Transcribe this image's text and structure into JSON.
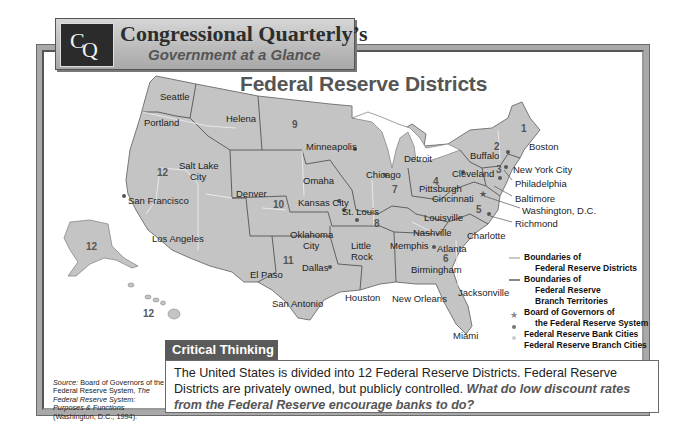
{
  "header": {
    "logo": {
      "c": "C",
      "q": "Q"
    },
    "title": "Congressional Quarterly’s",
    "subtitle": "Government at a Glance"
  },
  "map": {
    "title": "Federal Reserve Districts",
    "colors": {
      "land": "#c4c4c4",
      "boundary": "#555555",
      "branch": "#e8e8e8",
      "water": "#ffffff"
    },
    "cities": [
      {
        "name": "Seattle",
        "x": 160,
        "y": 91
      },
      {
        "name": "Portland",
        "x": 144,
        "y": 117
      },
      {
        "name": "Helena",
        "x": 226,
        "y": 113
      },
      {
        "name": "Salt Lake",
        "x": 179,
        "y": 160
      },
      {
        "name": "City",
        "x": 190,
        "y": 171
      },
      {
        "name": "San Francisco",
        "x": 128,
        "y": 195
      },
      {
        "name": "Los Angeles",
        "x": 152,
        "y": 233
      },
      {
        "name": "Denver",
        "x": 236,
        "y": 188
      },
      {
        "name": "Minneapolis",
        "x": 306,
        "y": 141
      },
      {
        "name": "Omaha",
        "x": 303,
        "y": 175
      },
      {
        "name": "Kansas City",
        "x": 298,
        "y": 197
      },
      {
        "name": "St. Louis",
        "x": 342,
        "y": 206
      },
      {
        "name": "Chicago",
        "x": 366,
        "y": 169
      },
      {
        "name": "Detroit",
        "x": 404,
        "y": 153
      },
      {
        "name": "Cleveland",
        "x": 452,
        "y": 168
      },
      {
        "name": "Pittsburgh",
        "x": 419,
        "y": 183
      },
      {
        "name": "Cincinnati",
        "x": 432,
        "y": 193
      },
      {
        "name": "Louisville",
        "x": 424,
        "y": 212
      },
      {
        "name": "Nashville",
        "x": 413,
        "y": 227
      },
      {
        "name": "Memphis",
        "x": 390,
        "y": 240
      },
      {
        "name": "Atlanta",
        "x": 437,
        "y": 243
      },
      {
        "name": "Birmingham",
        "x": 411,
        "y": 264
      },
      {
        "name": "Charlotte",
        "x": 467,
        "y": 230
      },
      {
        "name": "Buffalo",
        "x": 470,
        "y": 150
      },
      {
        "name": "Boston",
        "x": 529,
        "y": 141
      },
      {
        "name": "New York City",
        "x": 513,
        "y": 164
      },
      {
        "name": "Philadelphia",
        "x": 515,
        "y": 178
      },
      {
        "name": "Baltimore",
        "x": 515,
        "y": 193
      },
      {
        "name": "Washington, D.C.",
        "x": 522,
        "y": 205
      },
      {
        "name": "Richmond",
        "x": 515,
        "y": 218
      },
      {
        "name": "Oklahoma",
        "x": 290,
        "y": 229
      },
      {
        "name": "City",
        "x": 303,
        "y": 240
      },
      {
        "name": "Little",
        "x": 351,
        "y": 240
      },
      {
        "name": "Rock",
        "x": 351,
        "y": 251
      },
      {
        "name": "Dallas",
        "x": 302,
        "y": 262
      },
      {
        "name": "El Paso",
        "x": 250,
        "y": 269
      },
      {
        "name": "San Antonio",
        "x": 272,
        "y": 298
      },
      {
        "name": "Houston",
        "x": 345,
        "y": 292
      },
      {
        "name": "New Orleans",
        "x": 392,
        "y": 293
      },
      {
        "name": "Jacksonville",
        "x": 458,
        "y": 287
      },
      {
        "name": "Miami",
        "x": 453,
        "y": 330
      }
    ],
    "district_numbers": [
      {
        "label": "1",
        "x": 521,
        "y": 123
      },
      {
        "label": "2",
        "x": 494,
        "y": 141
      },
      {
        "label": "3",
        "x": 496,
        "y": 164
      },
      {
        "label": "4",
        "x": 433,
        "y": 176
      },
      {
        "label": "5",
        "x": 476,
        "y": 204
      },
      {
        "label": "6",
        "x": 443,
        "y": 253
      },
      {
        "label": "7",
        "x": 392,
        "y": 184
      },
      {
        "label": "8",
        "x": 374,
        "y": 218
      },
      {
        "label": "9",
        "x": 292,
        "y": 119
      },
      {
        "label": "10",
        "x": 273,
        "y": 199
      },
      {
        "label": "11",
        "x": 283,
        "y": 255
      },
      {
        "label": "12",
        "x": 157,
        "y": 167
      },
      {
        "label": "12",
        "x": 86,
        "y": 241
      },
      {
        "label": "12",
        "x": 143,
        "y": 308
      }
    ]
  },
  "legend": {
    "items": [
      {
        "symbol": "district-boundary",
        "lines": [
          "Boundaries of",
          "Federal Reserve Districts"
        ]
      },
      {
        "symbol": "branch-boundary",
        "lines": [
          "Boundaries of",
          "Federal Reserve",
          "Branch Territories"
        ]
      },
      {
        "symbol": "star",
        "lines": [
          "Board of Governors of",
          "the Federal Reserve System"
        ]
      },
      {
        "symbol": "bank-dot",
        "lines": [
          "Federal Reserve Bank Cities"
        ]
      },
      {
        "symbol": "branch-dot",
        "lines": [
          "Federal Reserve Branch Cities"
        ]
      }
    ]
  },
  "critical_thinking": {
    "heading": "Critical Thinking",
    "text": "The United States is divided into 12 Federal Reserve Districts. Federal Reserve Districts are privately owned, but publicly controlled. ",
    "question": "What do low discount rates from the Federal Reserve encourage banks to do?"
  },
  "source": {
    "label": "Source:",
    "text1": " Board of Governors of the Federal Reserve System, ",
    "title": "The Federal Reserve System: Purposes & Functions",
    "text2": " (Washington, D.C., 1994)."
  }
}
